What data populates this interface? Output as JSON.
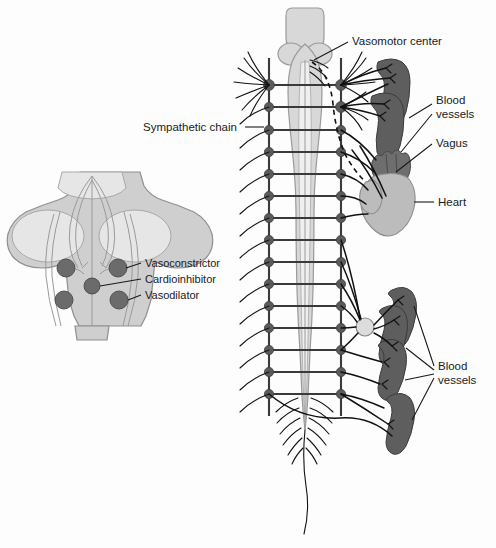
{
  "figure": {
    "background_color": "#fdfdfd",
    "ink_color": "#1a1a1a"
  },
  "labels": {
    "vasomotor_center": "Vasomotor center",
    "sympathetic_chain": "Sympathetic chain",
    "blood_vessels_upper_line1": "Blood",
    "blood_vessels_upper_line2": "vessels",
    "vagus": "Vagus",
    "heart": "Heart",
    "blood_vessels_lower_line1": "Blood",
    "blood_vessels_lower_line2": "vessels"
  },
  "inset": {
    "name": "medulla-brainstem-inset",
    "centers": [
      {
        "id": "vasoconstrictor",
        "label": "Vasoconstrictor",
        "color": "#6b6b6b"
      },
      {
        "id": "cardioinhibitor",
        "label": "Cardioinhibitor",
        "color": "#6b6b6b"
      },
      {
        "id": "vasodilator",
        "label": "Vasodilator",
        "color": "#6b6b6b"
      }
    ]
  },
  "structures": {
    "spinal_cord": "spinal-cord",
    "brainstem": "brainstem",
    "cauda_equina": "cauda-equina",
    "filum_terminale": "filum-terminale",
    "heart": "heart",
    "collateral_ganglion": "collateral-ganglion",
    "vagus_nerve": "vagus-nerve-dashed"
  },
  "counts": {
    "ganglia_per_chain": 14,
    "upper_blood_vessels": 2,
    "lower_blood_vessels": 4
  },
  "colors": {
    "cord": "#d8d8d8",
    "cord_inner": "#efefef",
    "ganglion": "#5b5b5b",
    "vessel": "#5e5e5e",
    "heart": "#bcbcbc",
    "inset": "#cfcfcf",
    "nerve": "#111111"
  }
}
